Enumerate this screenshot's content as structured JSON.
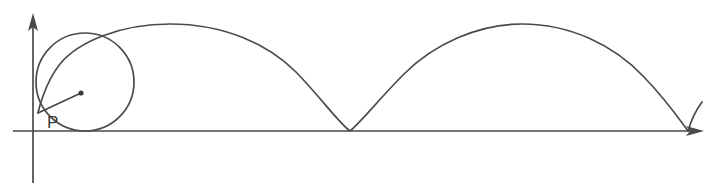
{
  "figure": {
    "type": "geometry-diagram",
    "background_color": "#ffffff",
    "stroke_color": "#4b4b4b",
    "label_color": "#3a3a3a"
  },
  "labels": {
    "point_p": "P"
  },
  "axes": {
    "x_axis": {
      "name": "x-axis",
      "y": 131,
      "x_start": 13,
      "x_end": 700,
      "has_arrow": true,
      "arrow_at": "right"
    },
    "y_axis": {
      "name": "y-axis",
      "x": 33,
      "y_start": 183,
      "y_end": 14,
      "has_arrow": true,
      "arrow_at": "top"
    }
  },
  "rolling_circle": {
    "name": "rolling-circle",
    "center_x": 85,
    "center_y": 82,
    "radius": 49,
    "tangent_point_x": 85,
    "tangent_point_y": 131
  },
  "center_marker": {
    "name": "circle-center-dot",
    "x": 81,
    "y": 93,
    "radius": 2.6
  },
  "tracing_point": {
    "name": "tracing-point-p",
    "x": 38,
    "y": 113,
    "label": "P",
    "label_x": 47,
    "label_y": 128
  },
  "radius_segment": {
    "name": "radius-segment",
    "from_x": 38,
    "from_y": 113,
    "to_x": 81,
    "to_y": 93
  },
  "chart_data": {
    "type": "line",
    "xlabel": "",
    "ylabel": "",
    "grid": false,
    "legend": null,
    "curve_name": "cycloid",
    "cusps_x": [
      38,
      350,
      688
    ],
    "arch_peaks": [
      {
        "x": 200,
        "y": 38
      },
      {
        "x": 518,
        "y": 38
      }
    ],
    "arch_count": 2,
    "partial_arch_start": {
      "x": 688,
      "y": 131
    },
    "partial_arch_end": {
      "x": 702,
      "y": 102
    },
    "baseline_y": 131,
    "arch_height": 93,
    "arch_width": 338
  },
  "path_definitions": {
    "cycloid_main": "M 38 113 C 38 113 44 84 60 64 C 78 42 120 24 170 24 C 224 24 268 44 296 72 C 322 99 338 122 350 131 C 362 121 380 98 404 74 C 434 44 478 24 522 24 C 570 24 614 45 644 77 C 668 102 682 123 688 131",
    "partial_arch": "M 688 131 C 690 124 694 113 702 102",
    "rolling_circle": "M 85 33 A 49 49 0 1 1 84.9 33",
    "x_axis": "M 13 131 L 694 131",
    "y_axis": "M 33 183 L 33 20",
    "x_arrow": "M 704 131 L 686 126 L 690 131 L 686 136 Z",
    "y_arrow": "M 33 13 L 28 31 L 33 27 L 38 31 Z"
  }
}
